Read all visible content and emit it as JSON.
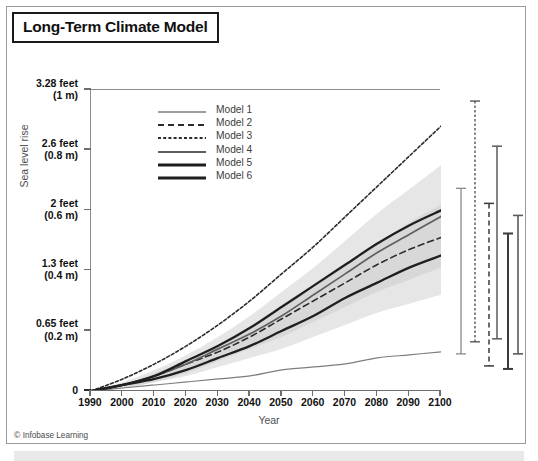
{
  "figure": {
    "title": "Long-Term Climate Model",
    "credit_symbol": "©",
    "credit": "Infobase Learning"
  },
  "axes": {
    "ylabel": "Sea level rise",
    "xlabel": "Year",
    "yticks": [
      {
        "feet": "3.28 feet",
        "meters": "(1 m)",
        "value": 1.0
      },
      {
        "feet": "2.6 feet",
        "meters": "(0.8 m)",
        "value": 0.8
      },
      {
        "feet": "2 feet",
        "meters": "(0.6 m)",
        "value": 0.6
      },
      {
        "feet": "1.3 feet",
        "meters": "(0.4 m)",
        "value": 0.4
      },
      {
        "feet": "0.65 feet",
        "meters": "(0.2 m)",
        "value": 0.2
      },
      {
        "feet": "0",
        "meters": "",
        "value": 0.0
      }
    ],
    "xticks": [
      "1990",
      "2000",
      "2010",
      "2020",
      "2030",
      "2040",
      "2050",
      "2060",
      "2070",
      "2080",
      "2090",
      "2100"
    ]
  },
  "legend": {
    "items": [
      {
        "label": "Model 1",
        "style": "thin-solid",
        "color": "#7d7d7d",
        "width": 1.2,
        "dash": ""
      },
      {
        "label": "Model 2",
        "style": "dashed",
        "color": "#2b2b2b",
        "width": 1.6,
        "dash": "6,4"
      },
      {
        "label": "Model 3",
        "style": "fine-dashed",
        "color": "#2b2b2b",
        "width": 1.6,
        "dash": "3,2.2"
      },
      {
        "label": "Model 4",
        "style": "solid",
        "color": "#5f5f5f",
        "width": 1.7,
        "dash": ""
      },
      {
        "label": "Model 5",
        "style": "solid-bold",
        "color": "#1f1f1f",
        "width": 2.3,
        "dash": ""
      },
      {
        "label": "Model 6",
        "style": "solid-bold",
        "color": "#1f1f1f",
        "width": 2.3,
        "dash": ""
      }
    ]
  },
  "chart_data": {
    "type": "line",
    "title": "Long-Term Climate Model",
    "xlabel": "Year",
    "ylabel": "Sea level rise",
    "xlim": [
      1990,
      2100
    ],
    "ylim": [
      0,
      1.0
    ],
    "y_unit": "m",
    "grid": false,
    "legend_position": "top-left-inside",
    "x": [
      1990,
      2000,
      2010,
      2020,
      2030,
      2040,
      2050,
      2060,
      2070,
      2080,
      2090,
      2100
    ],
    "series": [
      {
        "name": "Model 1",
        "values": [
          0.0,
          0.01,
          0.02,
          0.03,
          0.04,
          0.05,
          0.07,
          0.08,
          0.09,
          0.11,
          0.12,
          0.13
        ]
      },
      {
        "name": "Model 2",
        "values": [
          0.0,
          0.02,
          0.05,
          0.09,
          0.13,
          0.18,
          0.24,
          0.3,
          0.36,
          0.42,
          0.47,
          0.51
        ]
      },
      {
        "name": "Model 3",
        "values": [
          0.0,
          0.04,
          0.09,
          0.15,
          0.22,
          0.3,
          0.39,
          0.48,
          0.58,
          0.68,
          0.78,
          0.88
        ]
      },
      {
        "name": "Model 4",
        "values": [
          0.0,
          0.02,
          0.05,
          0.09,
          0.14,
          0.19,
          0.25,
          0.32,
          0.39,
          0.46,
          0.52,
          0.58
        ]
      },
      {
        "name": "Model 5",
        "values": [
          0.0,
          0.02,
          0.05,
          0.1,
          0.15,
          0.21,
          0.28,
          0.35,
          0.42,
          0.49,
          0.55,
          0.6
        ]
      },
      {
        "name": "Model 6",
        "values": [
          0.0,
          0.02,
          0.04,
          0.07,
          0.11,
          0.15,
          0.2,
          0.25,
          0.31,
          0.36,
          0.41,
          0.45
        ]
      }
    ],
    "uncertainty_bands": [
      {
        "name": "outer-band",
        "color": "#e6e6e6",
        "upper": [
          0.0,
          0.03,
          0.07,
          0.12,
          0.18,
          0.25,
          0.33,
          0.41,
          0.5,
          0.59,
          0.67,
          0.75
        ],
        "lower": [
          0.0,
          0.01,
          0.03,
          0.05,
          0.08,
          0.11,
          0.14,
          0.18,
          0.22,
          0.26,
          0.29,
          0.32
        ]
      },
      {
        "name": "inner-band",
        "color": "#d8d8d8",
        "upper": [
          0.0,
          0.02,
          0.06,
          0.1,
          0.15,
          0.21,
          0.28,
          0.35,
          0.42,
          0.49,
          0.56,
          0.62
        ],
        "lower": [
          0.0,
          0.01,
          0.03,
          0.06,
          0.1,
          0.14,
          0.18,
          0.23,
          0.28,
          0.33,
          0.37,
          0.41
        ]
      }
    ],
    "error_bars": [
      {
        "name": "Model 1 range",
        "style": "thin-solid",
        "color": "#8a8a8a",
        "width": 1.3,
        "dash": "",
        "low": 0.12,
        "high": 0.67
      },
      {
        "name": "Model 2 range",
        "style": "fine-dashed",
        "color": "#4a4a4a",
        "width": 1.3,
        "dash": "2.5,2",
        "low": 0.16,
        "high": 0.96
      },
      {
        "name": "Model 3 range",
        "style": "dashed",
        "color": "#3a3a3a",
        "width": 1.5,
        "dash": "5,3.5",
        "low": 0.08,
        "high": 0.62
      },
      {
        "name": "Model 4 range",
        "style": "solid",
        "color": "#5a5a5a",
        "width": 1.5,
        "dash": "",
        "low": 0.17,
        "high": 0.81
      },
      {
        "name": "Model 5 range",
        "style": "solid-bold",
        "color": "#3a3a3a",
        "width": 2.0,
        "dash": "",
        "low": 0.07,
        "high": 0.52
      },
      {
        "name": "Model 6 range",
        "style": "solid",
        "color": "#5a5a5a",
        "width": 1.6,
        "dash": "",
        "low": 0.12,
        "high": 0.58
      }
    ]
  }
}
